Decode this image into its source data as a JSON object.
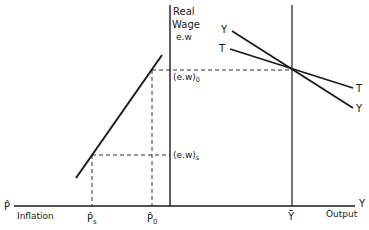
{
  "diagram": {
    "colors": {
      "ink": "#1a1a1a",
      "background": "#ffffff"
    },
    "y_axis": {
      "label_line1": "Real",
      "label_line2": "Wage",
      "label_line3": "e.w"
    },
    "x_axis": {
      "left_symbol": "P̂",
      "left_label": "Inflation",
      "right_symbol": "Y",
      "right_label": "Output"
    },
    "ticks": {
      "p_s": "P̂",
      "p_s_sub": "s",
      "p_0": "P̂",
      "p_0_sub": "0",
      "y_bar": "Ȳ"
    },
    "levels": {
      "ew0": "(e.w)",
      "ew0_sub": "0",
      "ews": "(e.w)",
      "ews_sub": "s"
    },
    "curves": {
      "YY_left": "Y",
      "YY_right": "Y",
      "TT_left": "T",
      "TT_right": "T"
    }
  }
}
